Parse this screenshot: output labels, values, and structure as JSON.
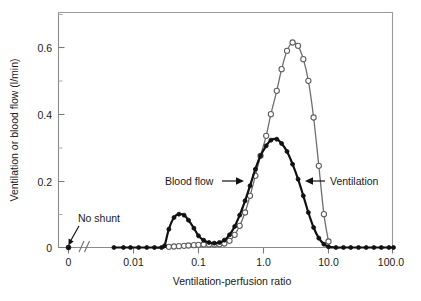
{
  "chart_data": {
    "type": "line",
    "title": "",
    "xlabel": "Ventilation-perfusion ratio",
    "ylabel": "Ventilation or blood flow (l/min)",
    "x_scale": "log",
    "x_axis_break": true,
    "x_break_label": "0",
    "xlim": [
      0.004,
      100.0
    ],
    "ylim": [
      0,
      0.68
    ],
    "xticklabels": [
      "0",
      "0.01",
      "0.1",
      "1.0",
      "10.0",
      "100.0"
    ],
    "xtickvalues": [
      0,
      0.01,
      0.1,
      1.0,
      10.0,
      100.0
    ],
    "yticklabels": [
      "0",
      "0.2",
      "0.4",
      "0.6"
    ],
    "ytickvalues": [
      0,
      0.2,
      0.4,
      0.6
    ],
    "y_minor_ticks": [
      0.1,
      0.3,
      0.5
    ],
    "grid": false,
    "legend_position": "inline-annotations",
    "annotations": [
      {
        "text": "No shunt",
        "target_x": 0,
        "target_y": 0
      },
      {
        "text": "Blood flow",
        "arrow": "right"
      },
      {
        "text": "Ventilation",
        "arrow": "left"
      }
    ],
    "series": [
      {
        "name": "Blood flow",
        "marker": "filled-circle",
        "color": "#111111",
        "shunt_point": {
          "x": 0,
          "y": 0
        },
        "x": [
          0.005,
          0.007,
          0.009,
          0.012,
          0.016,
          0.021,
          0.027,
          0.03,
          0.035,
          0.042,
          0.05,
          0.06,
          0.07,
          0.085,
          0.1,
          0.12,
          0.145,
          0.175,
          0.21,
          0.25,
          0.3,
          0.36,
          0.43,
          0.52,
          0.62,
          0.75,
          0.9,
          1.1,
          1.3,
          1.6,
          1.9,
          2.3,
          2.8,
          3.4,
          4.1,
          4.9,
          5.9,
          7.1,
          8.5,
          10.0,
          13,
          17,
          22,
          29,
          38,
          50,
          65,
          85,
          100
        ],
        "y": [
          0.0,
          0.0,
          0.0,
          0.0,
          0.0,
          0.0,
          0.0,
          0.005,
          0.055,
          0.09,
          0.1,
          0.097,
          0.082,
          0.058,
          0.035,
          0.022,
          0.015,
          0.013,
          0.015,
          0.022,
          0.038,
          0.063,
          0.097,
          0.14,
          0.185,
          0.235,
          0.275,
          0.305,
          0.322,
          0.325,
          0.312,
          0.288,
          0.25,
          0.205,
          0.155,
          0.105,
          0.06,
          0.028,
          0.01,
          0.002,
          0.0,
          0.0,
          0.0,
          0.0,
          0.0,
          0.0,
          0.0,
          0.0,
          0.0
        ]
      },
      {
        "name": "Ventilation",
        "marker": "open-circle",
        "color": "#6e6e6e",
        "x": [
          0.035,
          0.042,
          0.05,
          0.06,
          0.07,
          0.085,
          0.1,
          0.12,
          0.145,
          0.175,
          0.21,
          0.25,
          0.3,
          0.36,
          0.43,
          0.52,
          0.62,
          0.75,
          0.9,
          1.1,
          1.3,
          1.6,
          1.9,
          2.3,
          2.8,
          3.4,
          4.1,
          4.9,
          5.9,
          7.1,
          8.5,
          10.0
        ],
        "y": [
          0.002,
          0.003,
          0.004,
          0.005,
          0.006,
          0.007,
          0.008,
          0.009,
          0.009,
          0.009,
          0.01,
          0.012,
          0.02,
          0.038,
          0.065,
          0.105,
          0.155,
          0.215,
          0.275,
          0.335,
          0.4,
          0.47,
          0.535,
          0.59,
          0.615,
          0.605,
          0.565,
          0.5,
          0.39,
          0.245,
          0.1,
          0.018
        ]
      }
    ]
  },
  "axis": {
    "y_label": "Ventilation or blood flow (l/min)",
    "x_label": "Ventilation-perfusion ratio",
    "y_ticks": [
      "0.6",
      "0.4",
      "0.2",
      "0"
    ],
    "x_ticks": [
      "0",
      "0.01",
      "0.1",
      "1.0",
      "10.0",
      "100.0"
    ]
  },
  "labels": {
    "no_shunt": "No shunt",
    "blood_flow": "Blood flow",
    "ventilation": "Ventilation"
  }
}
